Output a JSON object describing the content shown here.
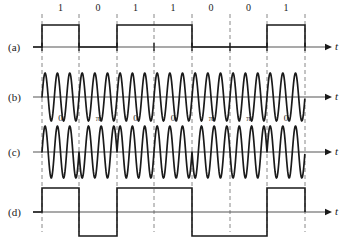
{
  "figure": {
    "width": 346,
    "height": 241,
    "background": "#ffffff",
    "ink_color": "#1a1a1a",
    "axis_color": "#555555",
    "grid_color": "#888888"
  },
  "axis_variable": "t",
  "rows": [
    {
      "label": "(a)",
      "name": "binary-data-signal",
      "baseline_y": 47,
      "label_y": 41
    },
    {
      "label": "(b)",
      "name": "carrier-signal",
      "baseline_y": 97,
      "label_y": 91
    },
    {
      "label": "(c)",
      "name": "psk-modulated-signal",
      "baseline_y": 152,
      "label_y": 146
    },
    {
      "label": "(d)",
      "name": "bipolar-nrz-signal",
      "baseline_y": 212,
      "label_y": 206
    }
  ],
  "timing": {
    "bit_boundaries_x": [
      42,
      79,
      117,
      154,
      192,
      230,
      267,
      305
    ],
    "bit_width": 37.5,
    "axis_start_x": 33,
    "axis_end_x": 332,
    "arrow_tip_x": 332,
    "t_label_x": 335
  },
  "chart_data": {
    "type": "line",
    "title": "",
    "xlabel": "t",
    "ylabel": "",
    "bit_sequence": [
      1,
      0,
      1,
      1,
      0,
      0,
      1
    ],
    "bit_labels": [
      "1",
      "0",
      "1",
      "1",
      "0",
      "0",
      "1"
    ],
    "phase_labels": [
      "0",
      "π",
      "0",
      "0",
      "π",
      "π",
      "0"
    ],
    "phase_values_rad": [
      0,
      3.14159,
      0,
      0,
      3.14159,
      3.14159,
      0
    ],
    "bipolar_levels": [
      1,
      -1,
      1,
      1,
      -1,
      -1,
      1
    ],
    "carrier_cycles_per_bit": 3,
    "series": [
      {
        "name": "(a) binary data (unipolar NRZ)",
        "type": "square",
        "levels": [
          1,
          0,
          1,
          1,
          0,
          0,
          1
        ],
        "amplitude_px": 22
      },
      {
        "name": "(b) unmodulated carrier",
        "type": "sine",
        "cycles_per_bit": 3,
        "phase": 0,
        "amplitude_px": 24
      },
      {
        "name": "(c) PSK modulated carrier",
        "type": "sine",
        "cycles_per_bit": 3,
        "phase_per_bit_rad": [
          0,
          3.14159,
          0,
          0,
          3.14159,
          3.14159,
          0
        ],
        "amplitude_px": 26
      },
      {
        "name": "(d) bipolar NRZ",
        "type": "square",
        "levels": [
          1,
          -1,
          1,
          1,
          -1,
          -1,
          1
        ],
        "amplitude_px": 24
      }
    ],
    "grid": true,
    "grid_style": "dashed-vertical-bit-boundaries",
    "legend": "none"
  }
}
